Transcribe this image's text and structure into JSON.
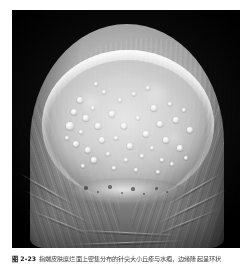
{
  "page": {
    "background_color": "#ffffff",
    "width": 251,
    "height": 265
  },
  "figure": {
    "photo": {
      "alt_description": "Close-up clinical photograph of a fingertip against a black background showing a large pale circular plaque with numerous small papules and vesicles",
      "border_color": "#050505",
      "background_color": "#000000",
      "skin_tone_color": "#b4b4b4",
      "lesion_color": "#e0e0e0",
      "rim_color": "#ffffff",
      "papule_color": "#fafafa"
    },
    "caption": {
      "number": "图 2-23",
      "text": "指端皮肤糜烂面上密集分布的针尖大小丘疹与水疱，边缘隆起呈环状"
    }
  },
  "lesion_papules": [
    {
      "x": 30,
      "y": 40,
      "r": 3.4
    },
    {
      "x": 24,
      "y": 52,
      "r": 3.0
    },
    {
      "x": 36,
      "y": 58,
      "r": 2.6
    },
    {
      "x": 20,
      "y": 66,
      "r": 3.6
    },
    {
      "x": 31,
      "y": 72,
      "r": 2.4
    },
    {
      "x": 43,
      "y": 48,
      "r": 2.2
    },
    {
      "x": 26,
      "y": 84,
      "r": 3.2
    },
    {
      "x": 38,
      "y": 90,
      "r": 2.8
    },
    {
      "x": 17,
      "y": 78,
      "r": 2.4
    },
    {
      "x": 48,
      "y": 66,
      "r": 2.6
    },
    {
      "x": 52,
      "y": 80,
      "r": 3.0
    },
    {
      "x": 44,
      "y": 100,
      "r": 2.6
    },
    {
      "x": 33,
      "y": 106,
      "r": 2.2
    },
    {
      "x": 58,
      "y": 94,
      "r": 2.4
    },
    {
      "x": 62,
      "y": 54,
      "r": 2.8
    },
    {
      "x": 70,
      "y": 40,
      "r": 2.4
    },
    {
      "x": 74,
      "y": 66,
      "r": 3.0
    },
    {
      "x": 66,
      "y": 78,
      "r": 2.2
    },
    {
      "x": 80,
      "y": 86,
      "r": 2.6
    },
    {
      "x": 88,
      "y": 58,
      "r": 2.4
    },
    {
      "x": 84,
      "y": 34,
      "r": 2.2
    },
    {
      "x": 96,
      "y": 74,
      "r": 2.8
    },
    {
      "x": 92,
      "y": 96,
      "r": 2.4
    },
    {
      "x": 104,
      "y": 48,
      "r": 2.6
    },
    {
      "x": 110,
      "y": 64,
      "r": 3.0
    },
    {
      "x": 102,
      "y": 88,
      "r": 2.2
    },
    {
      "x": 116,
      "y": 80,
      "r": 2.6
    },
    {
      "x": 120,
      "y": 44,
      "r": 2.4
    },
    {
      "x": 126,
      "y": 60,
      "r": 2.8
    },
    {
      "x": 112,
      "y": 100,
      "r": 2.4
    },
    {
      "x": 130,
      "y": 88,
      "r": 2.6
    },
    {
      "x": 134,
      "y": 50,
      "r": 2.2
    },
    {
      "x": 122,
      "y": 104,
      "r": 2.4
    },
    {
      "x": 140,
      "y": 70,
      "r": 2.8
    },
    {
      "x": 64,
      "y": 108,
      "r": 2.4
    },
    {
      "x": 76,
      "y": 100,
      "r": 2.2
    },
    {
      "x": 54,
      "y": 32,
      "r": 2.2
    },
    {
      "x": 46,
      "y": 24,
      "r": 2.0
    },
    {
      "x": 98,
      "y": 28,
      "r": 2.2
    },
    {
      "x": 108,
      "y": 112,
      "r": 2.2
    },
    {
      "x": 86,
      "y": 110,
      "r": 2.0
    },
    {
      "x": 136,
      "y": 98,
      "r": 2.2
    }
  ],
  "crust_specks": [
    {
      "x": 16,
      "y": 10,
      "r": 1.6
    },
    {
      "x": 28,
      "y": 14,
      "r": 1.2
    },
    {
      "x": 40,
      "y": 9,
      "r": 1.8
    },
    {
      "x": 52,
      "y": 15,
      "r": 1.3
    },
    {
      "x": 63,
      "y": 11,
      "r": 1.6
    },
    {
      "x": 74,
      "y": 16,
      "r": 1.2
    },
    {
      "x": 86,
      "y": 10,
      "r": 1.5
    },
    {
      "x": 97,
      "y": 14,
      "r": 1.1
    }
  ],
  "skin_creases": [
    {
      "x": 6,
      "y": 196,
      "w": 78,
      "rot": 26
    },
    {
      "x": 14,
      "y": 212,
      "w": 70,
      "rot": 22
    },
    {
      "x": 2,
      "y": 178,
      "w": 64,
      "rot": 30
    },
    {
      "x": 140,
      "y": 196,
      "w": 80,
      "rot": -26
    },
    {
      "x": 136,
      "y": 212,
      "w": 74,
      "rot": -22
    },
    {
      "x": 152,
      "y": 178,
      "w": 62,
      "rot": -30
    },
    {
      "x": 60,
      "y": 222,
      "w": 108,
      "rot": 3
    },
    {
      "x": 54,
      "y": 232,
      "w": 120,
      "rot": -2
    }
  ]
}
